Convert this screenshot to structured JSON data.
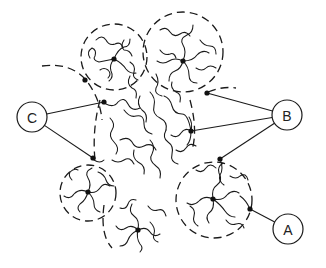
{
  "diagram": {
    "labels": [
      {
        "id": "A",
        "text": "A",
        "cx": 288,
        "cy": 229,
        "r": 15,
        "targets": [
          [
            250,
            209
          ]
        ]
      },
      {
        "id": "B",
        "text": "B",
        "cx": 287,
        "cy": 115,
        "r": 15,
        "targets": [
          [
            207,
            93
          ],
          [
            191,
            131
          ],
          [
            220,
            159
          ]
        ]
      },
      {
        "id": "C",
        "text": "C",
        "cx": 32,
        "cy": 117,
        "r": 15,
        "targets": [
          [
            104,
            102
          ],
          [
            93,
            158
          ]
        ]
      }
    ],
    "domains": [
      {
        "name": "top-left-domain",
        "cx": 114,
        "cy": 57,
        "r": 33
      },
      {
        "name": "top-right-domain",
        "cx": 183,
        "cy": 52,
        "r": 40
      },
      {
        "name": "bottom-left-domain",
        "cx": 88,
        "cy": 193,
        "r": 28
      },
      {
        "name": "bottom-right-domain",
        "cx": 214,
        "cy": 200,
        "r": 38
      }
    ],
    "nodes": [
      [
        114,
        59
      ],
      [
        183,
        61
      ],
      [
        104,
        102
      ],
      [
        93,
        158
      ],
      [
        207,
        93
      ],
      [
        191,
        131
      ],
      [
        220,
        159
      ],
      [
        213,
        199
      ],
      [
        250,
        209
      ],
      [
        88,
        192
      ],
      [
        138,
        230
      ],
      [
        85,
        80
      ]
    ],
    "colors": {
      "ink": "#1a1a1a",
      "background": "#ffffff"
    }
  }
}
